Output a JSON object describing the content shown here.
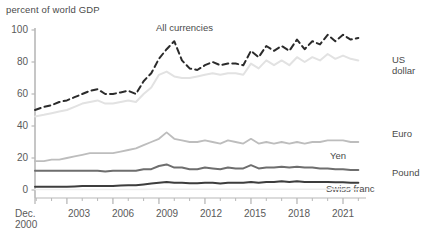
{
  "chart_data": {
    "type": "line",
    "title": "",
    "ylabel": "percent of world GDP",
    "xlabel": "",
    "ylim": [
      0,
      100
    ],
    "xlim": [
      2000.92,
      2022.5
    ],
    "grid": false,
    "legend_position": "inline-right",
    "yticks": [
      0,
      20,
      40,
      60,
      80,
      100
    ],
    "ytick_labels": [
      "0",
      "20",
      "40",
      "60",
      "80",
      "100"
    ],
    "xticks": [
      2000.92,
      2003,
      2006,
      2009,
      2012,
      2015,
      2018,
      2021
    ],
    "xtick_labels": [
      "Dec.\n2000",
      "2003",
      "2006",
      "2009",
      "2012",
      "2015",
      "2018",
      "2021"
    ],
    "xtick_minor_step": 1,
    "x": [
      2000.92,
      2001.5,
      2002,
      2002.5,
      2003,
      2003.5,
      2004,
      2004.5,
      2005,
      2005.5,
      2006,
      2006.5,
      2007,
      2007.5,
      2008,
      2008.5,
      2009,
      2009.5,
      2010,
      2010.5,
      2011,
      2011.5,
      2012,
      2012.5,
      2013,
      2013.5,
      2014,
      2014.5,
      2015,
      2015.5,
      2016,
      2016.5,
      2017,
      2017.5,
      2018,
      2018.5,
      2019,
      2019.5,
      2020,
      2020.5,
      2021,
      2021.5,
      2022
    ],
    "series": [
      {
        "name": "All currencies",
        "color": "#2b2b2b",
        "style": "dashed",
        "width": 2.0,
        "label_position": "above-line",
        "values": [
          50,
          52,
          53,
          55,
          56,
          58,
          60,
          62,
          63,
          60,
          60,
          61,
          62,
          60,
          68,
          73,
          82,
          88,
          93,
          81,
          76,
          75,
          78,
          80,
          78,
          79,
          79,
          78,
          87,
          83,
          90,
          87,
          90,
          87,
          94,
          88,
          93,
          91,
          97,
          93,
          97,
          94,
          95
        ]
      },
      {
        "name": "US dollar",
        "color": "#e2e2e2",
        "style": "solid",
        "width": 2.0,
        "label_position": "right",
        "values": [
          46,
          47,
          48,
          49,
          50,
          52,
          54,
          55,
          56,
          54,
          54,
          55,
          56,
          55,
          60,
          64,
          72,
          74,
          71,
          70,
          70,
          71,
          72,
          73,
          72,
          73,
          73,
          72,
          79,
          76,
          81,
          78,
          81,
          78,
          83,
          80,
          83,
          81,
          85,
          82,
          84,
          82,
          81
        ]
      },
      {
        "name": "Euro",
        "color": "#bdbdbd",
        "style": "solid",
        "width": 1.8,
        "label_position": "right",
        "values": [
          18,
          18,
          19,
          19,
          20,
          21,
          22,
          23,
          23,
          23,
          23,
          24,
          25,
          26,
          28,
          30,
          32,
          36,
          32,
          31,
          30,
          30,
          31,
          30,
          29,
          31,
          30,
          29,
          32,
          29,
          30,
          29,
          30,
          29,
          30,
          29,
          30,
          30,
          31,
          31,
          31,
          30,
          30
        ]
      },
      {
        "name": "Yen",
        "color": "#6e6e6e",
        "style": "solid",
        "width": 2.0,
        "label_position": "above-line",
        "values": [
          12,
          12,
          12,
          12,
          12,
          12,
          12,
          12,
          12,
          11.5,
          12,
          12,
          12,
          12,
          13,
          13,
          15,
          16,
          14,
          14,
          13,
          13,
          14,
          13.5,
          13,
          14,
          13.5,
          13.5,
          15.5,
          13.5,
          14,
          14,
          14.5,
          14,
          14.5,
          14,
          14,
          13.5,
          13.5,
          13,
          13,
          12.5,
          12.5
        ]
      },
      {
        "name": "Pound",
        "color": "#3d3d3d",
        "style": "solid",
        "width": 2.0,
        "label_position": "right",
        "values": [
          2,
          2,
          2,
          2,
          2,
          2.2,
          2.5,
          2.5,
          2.5,
          2.5,
          2.5,
          2.8,
          3,
          3,
          3.5,
          4,
          4.5,
          5,
          4.5,
          4.5,
          4.2,
          4.2,
          4.5,
          4.5,
          4,
          4.5,
          4.5,
          4.5,
          5,
          4.5,
          5,
          5,
          5.5,
          5,
          5.5,
          5,
          5,
          5,
          5,
          4.8,
          4.8,
          4.5,
          4.5
        ]
      },
      {
        "name": "Swiss franc",
        "color": "#ededed",
        "style": "solid",
        "width": 1.6,
        "label_position": "above-line",
        "values": [
          0.3,
          0.3,
          0.3,
          0.3,
          0.3,
          0.3,
          0.3,
          0.3,
          0.3,
          0.3,
          0.3,
          0.3,
          0.3,
          0.3,
          0.4,
          0.5,
          0.6,
          0.6,
          0.5,
          0.5,
          0.5,
          0.5,
          0.5,
          0.5,
          0.5,
          0.5,
          0.5,
          0.5,
          0.6,
          0.5,
          0.5,
          0.5,
          0.5,
          0.5,
          0.5,
          0.5,
          0.5,
          0.5,
          0.5,
          0.5,
          0.5,
          0.5,
          0.5
        ]
      }
    ],
    "annotations": [
      {
        "text": "All currencies",
        "x_px": 156,
        "y_px": 27
      },
      {
        "text": "US",
        "x_px": 392,
        "y_px": 59
      },
      {
        "text": "dollar",
        "x_px": 392,
        "y_px": 70
      },
      {
        "text": "Euro",
        "x_px": 392,
        "y_px": 133
      },
      {
        "text": "Yen",
        "x_px": 330,
        "y_px": 155
      },
      {
        "text": "Pound",
        "x_px": 392,
        "y_px": 172
      },
      {
        "text": "Swiss franc",
        "x_px": 326,
        "y_px": 188
      }
    ]
  },
  "axis": {
    "ylabel": "percent of world GDP",
    "ytick_labels": [
      "100",
      "80",
      "60",
      "40",
      "20",
      "0"
    ],
    "xtick_labels": [
      "Dec.",
      "2000",
      "2003",
      "2006",
      "2009",
      "2012",
      "2015",
      "2018",
      "2021"
    ]
  },
  "colors": {
    "axis": "#b8b8b8",
    "text": "#4a4a4a",
    "background": "#ffffff"
  }
}
